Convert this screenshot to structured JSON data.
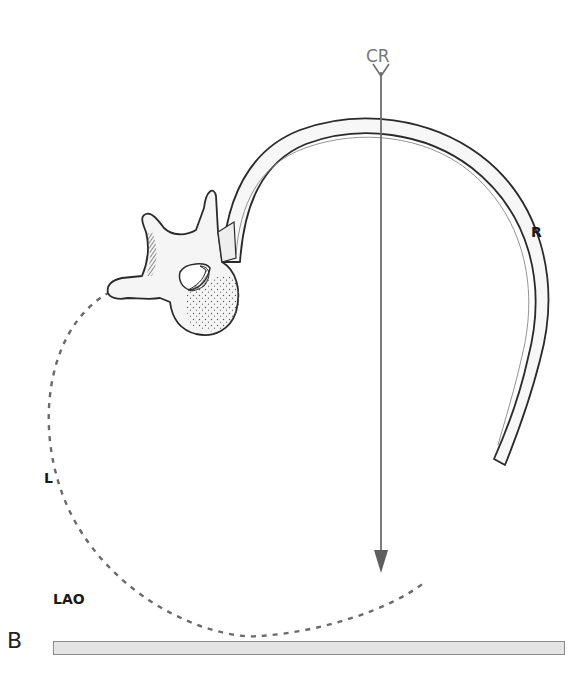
{
  "figure": {
    "panel_label": "B",
    "labels": {
      "central_ray": "CR",
      "right": "R",
      "left": "L",
      "projection": "LAO"
    },
    "elements": {
      "vertebra": "thoracic vertebra (superior view)",
      "rib": "right rib curving anteriorly",
      "central_ray": "vertical arrow pointing down to image receptor",
      "dashed_path": "dashed curve outlining left side of body",
      "image_receptor": "horizontal plate at bottom"
    },
    "colors": {
      "outline": "#2a2a2a",
      "bone_fill": "#f7f7f7",
      "ray": "#6e6e6e",
      "dashed": "#6a6a6a",
      "plate_fill": "#e4e4e4",
      "plate_border": "#8a8a8a",
      "body_stipple": "#555555"
    }
  }
}
